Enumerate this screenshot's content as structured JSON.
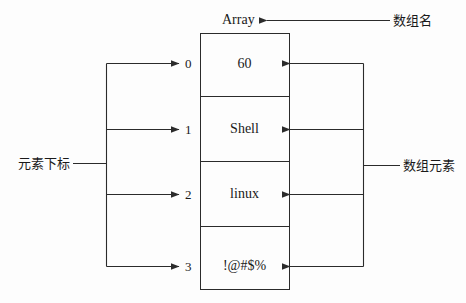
{
  "diagram": {
    "title_label": "Array",
    "array": {
      "cells": [
        {
          "index": "0",
          "value": "60"
        },
        {
          "index": "1",
          "value": "Shell"
        },
        {
          "index": "2",
          "value": "linux"
        },
        {
          "index": "3",
          "value": "!@#$%"
        }
      ]
    },
    "annotations": {
      "array_name": "数组名",
      "element_index": "元素下标",
      "array_elements": "数组元素"
    },
    "colors": {
      "stroke": "#2b2b2b",
      "text": "#1a1a1a",
      "background": "#fdfdfd"
    }
  }
}
